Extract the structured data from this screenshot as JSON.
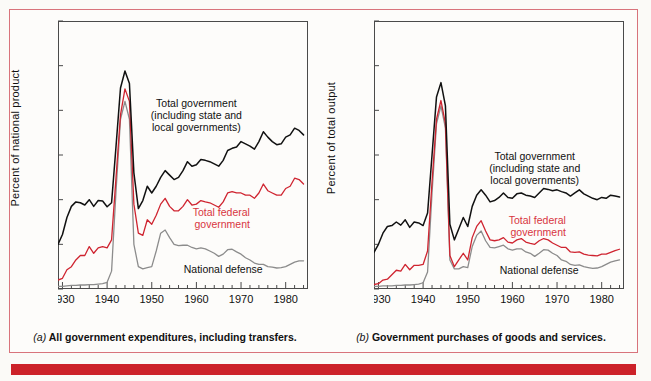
{
  "figure": {
    "panels": [
      {
        "id": "a",
        "ylabel": "Percent of national product",
        "caption_prefix": "(a)",
        "caption": " All government expenditures, including transfers.",
        "annotations": {
          "total_government": "Total government\n(including state and\nlocal governments)",
          "total_government_l1": "Total government",
          "total_government_l2": "(including state and",
          "total_government_l3": "local governments)",
          "total_federal_l1": "Total federal",
          "total_federal_l2": "government",
          "national_defense": "National defense"
        }
      },
      {
        "id": "b",
        "ylabel": "Percent of total output",
        "caption_prefix": "(b)",
        "caption": " Government purchases of goods and services.",
        "annotations": {
          "total_government_l1": "Total government",
          "total_government_l2": "(including state and",
          "total_government_l3": "local governments)",
          "total_federal_l1": "Total federal",
          "total_federal_l2": "government",
          "national_defense": "National defense"
        }
      }
    ],
    "colors": {
      "total_government": "#111111",
      "total_federal": "#cf2430",
      "national_defense": "#8c8c8c",
      "frame_red": "#d8737b",
      "bottom_bar_red": "#cc2229",
      "axis": "#4a4a4a",
      "page_bg": "#fbfaf7"
    }
  },
  "chart_data": [
    {
      "type": "line",
      "title": "(a) All government expenditures, including transfers.",
      "xlabel": "",
      "ylabel": "Percent of national product",
      "xlim": [
        1929,
        1985
      ],
      "ylim": [
        0,
        60
      ],
      "xticks": [
        1930,
        1940,
        1950,
        1960,
        1970,
        1980
      ],
      "xtick_labels": [
        "1930",
        "1940",
        "1950",
        "1960",
        "1970",
        "1980"
      ],
      "x_minor_tick_step": 2,
      "yticks": [
        0,
        10,
        20,
        30,
        40,
        50,
        60
      ],
      "ytick_labels": [
        "0",
        "10",
        "20",
        "30",
        "40",
        "50",
        "60"
      ],
      "grid": false,
      "legend": "annotations-inline",
      "x": [
        1929,
        1930,
        1931,
        1932,
        1933,
        1934,
        1935,
        1936,
        1937,
        1938,
        1939,
        1940,
        1941,
        1942,
        1943,
        1944,
        1945,
        1946,
        1947,
        1948,
        1949,
        1950,
        1951,
        1952,
        1953,
        1954,
        1955,
        1956,
        1957,
        1958,
        1959,
        1960,
        1961,
        1962,
        1963,
        1964,
        1965,
        1966,
        1967,
        1968,
        1969,
        1970,
        1971,
        1972,
        1973,
        1974,
        1975,
        1976,
        1977,
        1978,
        1979,
        1980,
        1981,
        1982,
        1983,
        1984
      ],
      "series": [
        {
          "name": "Total government (including state and local governments)",
          "color": "#111111",
          "values": [
            10.0,
            12.2,
            16.0,
            18.5,
            19.5,
            19.3,
            18.8,
            20.0,
            18.5,
            19.8,
            19.7,
            18.4,
            19.3,
            32.0,
            45.0,
            48.8,
            46.0,
            26.0,
            18.0,
            19.8,
            23.0,
            21.5,
            23.0,
            25.0,
            26.5,
            25.5,
            24.5,
            25.0,
            26.5,
            28.5,
            27.5,
            27.8,
            29.0,
            28.8,
            28.5,
            28.0,
            27.5,
            28.8,
            31.0,
            31.5,
            31.8,
            33.0,
            32.5,
            32.0,
            31.3,
            33.0,
            35.2,
            34.0,
            33.0,
            32.3,
            32.5,
            34.0,
            34.5,
            36.0,
            35.5,
            34.5
          ]
        },
        {
          "name": "Total federal government",
          "color": "#cf2430",
          "values": [
            2.0,
            2.4,
            4.3,
            5.0,
            6.5,
            7.5,
            7.5,
            9.5,
            8.0,
            9.2,
            9.5,
            9.2,
            11.0,
            25.0,
            39.0,
            44.8,
            42.0,
            19.0,
            12.5,
            12.0,
            15.5,
            14.5,
            16.5,
            19.0,
            20.3,
            18.5,
            17.5,
            17.5,
            18.5,
            20.0,
            18.8,
            19.0,
            19.8,
            19.5,
            19.3,
            18.8,
            18.3,
            19.5,
            21.5,
            21.8,
            21.5,
            21.5,
            21.0,
            21.0,
            20.3,
            21.5,
            23.5,
            22.0,
            21.5,
            21.0,
            21.0,
            22.5,
            23.0,
            24.8,
            24.5,
            23.5
          ]
        },
        {
          "name": "National defense",
          "color": "#8c8c8c",
          "values": [
            0.6,
            0.6,
            0.7,
            0.8,
            0.8,
            0.9,
            0.9,
            1.0,
            1.0,
            1.1,
            1.2,
            1.5,
            4.0,
            22.0,
            38.0,
            42.0,
            38.0,
            10.0,
            5.0,
            4.5,
            4.8,
            5.0,
            8.5,
            12.5,
            13.2,
            11.5,
            10.0,
            9.7,
            9.8,
            9.8,
            9.3,
            9.0,
            9.2,
            9.0,
            8.5,
            8.0,
            7.3,
            7.8,
            8.8,
            8.9,
            8.3,
            7.8,
            7.0,
            6.5,
            5.8,
            5.5,
            5.5,
            5.0,
            4.9,
            4.7,
            4.8,
            5.0,
            5.5,
            6.0,
            6.3,
            6.3
          ]
        }
      ],
      "annotations": [
        {
          "text": "Total government (including state and local governments)",
          "x": 1960,
          "y": 39
        },
        {
          "text": "Total federal government",
          "x": 1972,
          "y": 16
        },
        {
          "text": "National defense",
          "x": 1966,
          "y": 4.5
        }
      ]
    },
    {
      "type": "line",
      "title": "(b) Government purchases of goods and services.",
      "xlabel": "",
      "ylabel": "Percent of total output",
      "xlim": [
        1929,
        1985
      ],
      "ylim": [
        0,
        60
      ],
      "xticks": [
        1930,
        1940,
        1950,
        1960,
        1970,
        1980
      ],
      "xtick_labels": [
        "1930",
        "1940",
        "1950",
        "1960",
        "1970",
        "1980"
      ],
      "x_minor_tick_step": 2,
      "yticks": [
        0,
        10,
        20,
        30,
        40,
        50,
        60
      ],
      "ytick_labels": [
        "0",
        "10",
        "20",
        "30",
        "40",
        "50",
        "60"
      ],
      "grid": false,
      "legend": "annotations-inline",
      "x": [
        1929,
        1930,
        1931,
        1932,
        1933,
        1934,
        1935,
        1936,
        1937,
        1938,
        1939,
        1940,
        1941,
        1942,
        1943,
        1944,
        1945,
        1946,
        1947,
        1948,
        1949,
        1950,
        1951,
        1952,
        1953,
        1954,
        1955,
        1956,
        1957,
        1958,
        1959,
        1960,
        1961,
        1962,
        1963,
        1964,
        1965,
        1966,
        1967,
        1968,
        1969,
        1970,
        1971,
        1972,
        1973,
        1974,
        1975,
        1976,
        1977,
        1978,
        1979,
        1980,
        1981,
        1982,
        1983,
        1984
      ],
      "values_note": "three series as below",
      "series": [
        {
          "name": "Total government (including state and local governments)",
          "color": "#111111",
          "values": [
            8.2,
            10.0,
            12.5,
            14.0,
            14.2,
            15.0,
            14.3,
            15.5,
            13.8,
            15.0,
            14.8,
            14.2,
            17.0,
            30.0,
            43.0,
            46.2,
            41.0,
            14.5,
            11.0,
            13.5,
            16.0,
            14.0,
            18.5,
            21.0,
            22.2,
            21.0,
            19.5,
            19.8,
            20.5,
            21.5,
            20.5,
            20.3,
            21.3,
            21.5,
            21.0,
            20.8,
            20.5,
            21.5,
            22.5,
            22.3,
            22.0,
            22.2,
            21.8,
            21.5,
            20.8,
            21.5,
            22.2,
            21.3,
            20.8,
            20.3,
            20.0,
            20.5,
            20.3,
            21.0,
            20.8,
            20.6
          ]
        },
        {
          "name": "Total federal government",
          "color": "#cf2430",
          "values": [
            1.0,
            1.2,
            2.0,
            2.2,
            3.2,
            4.2,
            4.0,
            5.5,
            4.3,
            5.3,
            5.3,
            5.5,
            8.5,
            24.0,
            38.0,
            42.2,
            37.0,
            7.5,
            5.0,
            6.5,
            8.0,
            6.5,
            11.5,
            14.0,
            15.3,
            13.0,
            11.0,
            10.8,
            11.0,
            11.5,
            10.5,
            10.3,
            11.0,
            11.3,
            10.5,
            10.2,
            10.0,
            10.8,
            11.3,
            11.0,
            10.3,
            9.8,
            9.3,
            9.3,
            8.3,
            8.2,
            8.3,
            7.8,
            7.6,
            7.5,
            7.4,
            7.8,
            7.8,
            8.2,
            8.6,
            8.9
          ]
        },
        {
          "name": "National defense",
          "color": "#8c8c8c",
          "values": [
            0.6,
            0.6,
            0.7,
            0.7,
            0.7,
            0.8,
            0.8,
            0.9,
            0.9,
            1.0,
            1.1,
            1.4,
            3.8,
            21.5,
            37.0,
            41.0,
            36.0,
            6.5,
            4.5,
            4.5,
            5.0,
            4.8,
            9.5,
            12.0,
            13.0,
            10.8,
            9.3,
            9.2,
            9.5,
            9.8,
            9.0,
            8.7,
            9.0,
            9.0,
            8.3,
            8.0,
            7.3,
            8.0,
            8.8,
            8.7,
            8.0,
            7.5,
            6.5,
            6.2,
            5.5,
            5.3,
            5.4,
            5.0,
            4.8,
            4.6,
            4.7,
            5.0,
            5.5,
            6.0,
            6.3,
            6.5
          ]
        }
      ],
      "annotations": [
        {
          "text": "Total government (including state and local governments)",
          "x": 1965,
          "y": 27
        },
        {
          "text": "Total federal government",
          "x": 1972,
          "y": 14
        },
        {
          "text": "National defense",
          "x": 1966,
          "y": 4.2
        }
      ]
    }
  ]
}
